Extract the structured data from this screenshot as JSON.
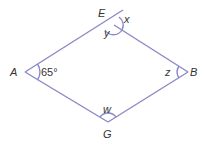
{
  "diagram": {
    "type": "rhombus-angles",
    "line_color": "#8a88c8",
    "text_color": "#333333",
    "vertices": {
      "E": {
        "label": "E",
        "x": 114,
        "y": 25
      },
      "A": {
        "label": "A",
        "x": 25,
        "y": 72
      },
      "B": {
        "label": "B",
        "x": 188,
        "y": 72
      },
      "G": {
        "label": "G",
        "x": 108,
        "y": 122
      }
    },
    "extension_end": {
      "x": 123,
      "y": 10
    },
    "angles": {
      "A": {
        "label": "65°"
      },
      "E_exterior": {
        "label": "x"
      },
      "E_interior": {
        "label": "y"
      },
      "B": {
        "label": "z"
      },
      "G": {
        "label": "w"
      }
    }
  }
}
